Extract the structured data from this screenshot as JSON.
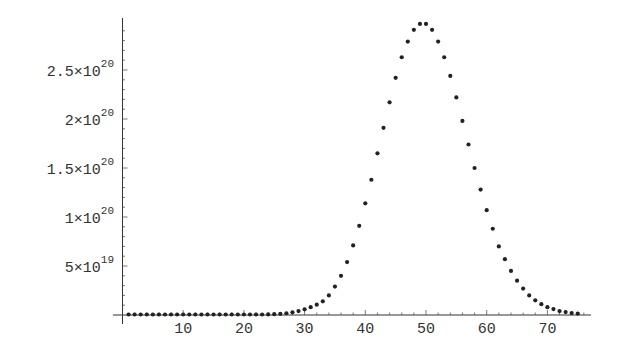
{
  "chart_data": {
    "type": "scatter",
    "title": "",
    "xlabel": "",
    "ylabel": "",
    "xlim": [
      0,
      77
    ],
    "ylim": [
      0,
      3e+20
    ],
    "grid": false,
    "legend": null,
    "x_ticks": [
      10,
      20,
      30,
      40,
      50,
      60,
      70
    ],
    "x_tick_labels": [
      "10",
      "20",
      "30",
      "40",
      "50",
      "60",
      "70"
    ],
    "y_ticks": [
      5e+19,
      1e+20,
      1.5e+20,
      2e+20,
      2.5e+20
    ],
    "y_tick_labels": [
      {
        "mantissa": "5",
        "exp": "19"
      },
      {
        "mantissa": "1",
        "exp": "20"
      },
      {
        "mantissa": "1.5",
        "exp": "20"
      },
      {
        "mantissa": "2",
        "exp": "20"
      },
      {
        "mantissa": "2.5",
        "exp": "20"
      }
    ],
    "series": [
      {
        "name": "points",
        "color": "#222222",
        "x": [
          1,
          2,
          3,
          4,
          5,
          6,
          7,
          8,
          9,
          10,
          11,
          12,
          13,
          14,
          15,
          16,
          17,
          18,
          19,
          20,
          21,
          22,
          23,
          24,
          25,
          26,
          27,
          28,
          29,
          30,
          31,
          32,
          33,
          34,
          35,
          36,
          37,
          38,
          39,
          40,
          41,
          42,
          43,
          44,
          45,
          46,
          47,
          48,
          49,
          50,
          51,
          52,
          53,
          54,
          55,
          56,
          57,
          58,
          59,
          60,
          61,
          62,
          63,
          64,
          65,
          66,
          67,
          68,
          69,
          70,
          71,
          72,
          73,
          74,
          75
        ],
        "y_e20": [
          0,
          0,
          0,
          0,
          0,
          0,
          0,
          0,
          0,
          0,
          0,
          0,
          0,
          0,
          0,
          0,
          0,
          0,
          0,
          0,
          0,
          0.002,
          0.004,
          0.006,
          0.008,
          0.012,
          0.018,
          0.027,
          0.04,
          0.058,
          0.08,
          0.105,
          0.14,
          0.2,
          0.29,
          0.4,
          0.54,
          0.71,
          0.91,
          1.14,
          1.38,
          1.65,
          1.91,
          2.17,
          2.42,
          2.63,
          2.79,
          2.91,
          2.97,
          2.97,
          2.91,
          2.79,
          2.63,
          2.44,
          2.22,
          1.98,
          1.74,
          1.5,
          1.28,
          1.07,
          0.88,
          0.7,
          0.57,
          0.45,
          0.35,
          0.27,
          0.2,
          0.15,
          0.11,
          0.08,
          0.06,
          0.04,
          0.03,
          0.02,
          0.015
        ]
      }
    ]
  }
}
